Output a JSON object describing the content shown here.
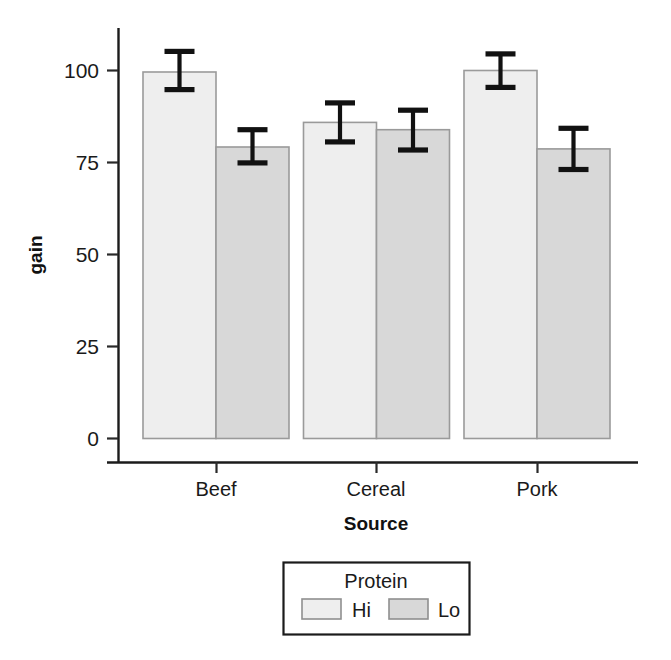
{
  "chart_data": {
    "type": "bar",
    "title": "",
    "subtitle": "",
    "xlabel": "Source",
    "ylabel": "gain",
    "categories": [
      "Beef",
      "Cereal",
      "Pork"
    ],
    "series": [
      {
        "name": "Hi",
        "color": "#eeeeee",
        "values": [
          99.6,
          85.9,
          100.0
        ],
        "error_low": [
          94.8,
          80.6,
          95.4
        ],
        "error_high": [
          105.2,
          91.2,
          104.5
        ]
      },
      {
        "name": "Lo",
        "color": "#d8d8d8",
        "values": [
          79.2,
          83.9,
          78.7
        ],
        "error_low": [
          74.9,
          78.4,
          73.1
        ],
        "error_high": [
          83.9,
          89.2,
          84.3
        ]
      }
    ],
    "ylim": [
      0,
      112
    ],
    "xlim": [
      0,
      3
    ],
    "yticks": [
      0,
      25,
      50,
      75,
      100
    ],
    "ytick_labels": [
      "0",
      "25",
      "50",
      "75",
      "100"
    ],
    "grid": false,
    "legend": {
      "title": "Protein",
      "position": "bottom",
      "entries": [
        {
          "label": "Hi",
          "color": "#eeeeee"
        },
        {
          "label": "Lo",
          "color": "#d8d8d8"
        }
      ]
    },
    "error_bar_type": "confidence-interval",
    "axis_color": "#1b1b1b",
    "bar_border_color": "#9a9a9a",
    "error_bar_color": "#111111",
    "background": "#ffffff"
  },
  "axis": {
    "y_title": "gain",
    "x_title": "Source",
    "y_tick_0": "0",
    "y_tick_25": "25",
    "y_tick_50": "50",
    "y_tick_75": "75",
    "y_tick_100": "100",
    "x_tick_0": "Beef",
    "x_tick_1": "Cereal",
    "x_tick_2": "Pork"
  },
  "legend": {
    "title": "Protein",
    "entry_0_label": "Hi",
    "entry_1_label": "Lo"
  }
}
